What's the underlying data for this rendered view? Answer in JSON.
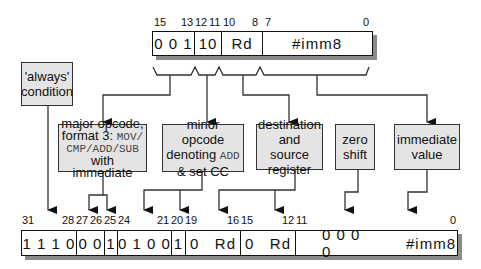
{
  "thumb_instruction": {
    "bit_labels": [
      {
        "text": "15",
        "x": 154
      },
      {
        "text": "13",
        "x": 181
      },
      {
        "text": "12",
        "x": 195
      },
      {
        "text": "11",
        "x": 209
      },
      {
        "text": "10",
        "x": 223
      },
      {
        "text": "8",
        "x": 252
      },
      {
        "text": "7",
        "x": 265
      },
      {
        "text": "0",
        "x": 363
      }
    ],
    "fields": [
      "0 0 1",
      "10",
      "Rd",
      "#imm8"
    ]
  },
  "annotation_boxes": {
    "always_condition": {
      "line1": "'always'",
      "line2": "condition"
    },
    "major_opcode": {
      "line1": "major opcode,",
      "line2a": "format 3: ",
      "line2b": "MOV/",
      "line3": "CMP/ADD/SUB",
      "line4": "with immediate"
    },
    "minor_opcode": {
      "line1": "minor opcode",
      "line2a": "denoting ",
      "line2b": "ADD",
      "line3": "& set  CC"
    },
    "dest_source_register": {
      "line1": "destination",
      "line2": "and source",
      "line3": "register"
    },
    "zero_shift": {
      "line1": "zero",
      "line2": "shift"
    },
    "immediate_value": {
      "line1": "immediate",
      "line2": "value"
    }
  },
  "arm_instruction": {
    "bit_labels": [
      {
        "text": "31",
        "x": 22
      },
      {
        "text": "28",
        "x": 62
      },
      {
        "text": "27",
        "x": 76
      },
      {
        "text": "26",
        "x": 90
      },
      {
        "text": "25",
        "x": 104
      },
      {
        "text": "24",
        "x": 118
      },
      {
        "text": "21",
        "x": 157
      },
      {
        "text": "20",
        "x": 171
      },
      {
        "text": "19",
        "x": 185
      },
      {
        "text": "16",
        "x": 227
      },
      {
        "text": "15",
        "x": 241
      },
      {
        "text": "12",
        "x": 282
      },
      {
        "text": "11",
        "x": 296
      },
      {
        "text": "0",
        "x": 450
      }
    ],
    "fields": [
      "1 1 1 0",
      "0 0",
      "1",
      "0 1 0 0",
      "1",
      "0   Rd",
      "0   Rd",
      "0 0 0 0",
      "#imm8"
    ]
  }
}
